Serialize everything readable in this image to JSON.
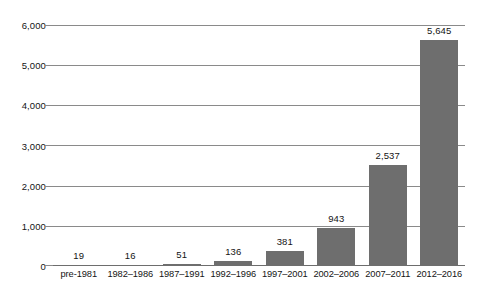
{
  "chart_data": {
    "type": "bar",
    "title": "",
    "subtitle": "",
    "xlabel": "",
    "ylabel": "",
    "categories": [
      "pre-1981",
      "1982–1986",
      "1987–1991",
      "1992–1996",
      "1997–2001",
      "2002–2006",
      "2007–2011",
      "2012–2016"
    ],
    "values": [
      19,
      16,
      51,
      136,
      381,
      943,
      2537,
      5645
    ],
    "value_labels": [
      "19",
      "16",
      "51",
      "136",
      "381",
      "943",
      "2,537",
      "5,645"
    ],
    "ylim": [
      0,
      6000
    ],
    "yticks": [
      0,
      1000,
      2000,
      3000,
      4000,
      5000,
      6000
    ],
    "ytick_labels": [
      "0",
      "1,000",
      "2,000",
      "3,000",
      "4,000",
      "5,000",
      "6,000"
    ],
    "grid": true,
    "legend": false,
    "legend_position": "none",
    "series": [
      {
        "name": "",
        "values": [
          19,
          16,
          51,
          136,
          381,
          943,
          2537,
          5645
        ]
      }
    ],
    "colors": {
      "bar": "#6e6e6e",
      "gridline": "#8a8a8a",
      "axis": "#6d6d6d",
      "text": "#141414",
      "background": "#ffffff"
    }
  }
}
